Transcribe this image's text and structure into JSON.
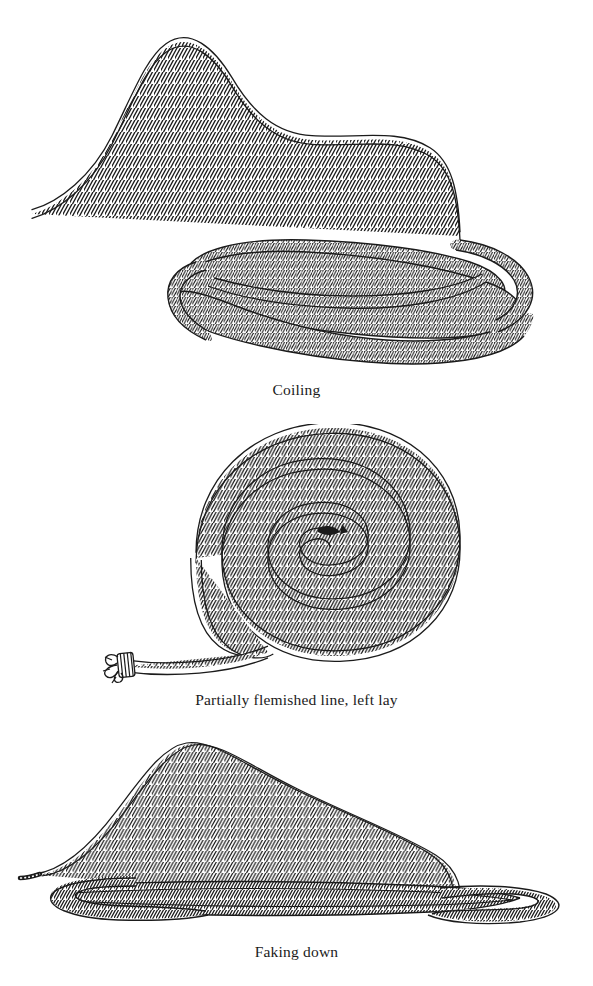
{
  "page": {
    "background_color": "#ffffff",
    "ink_color": "#1b1b1b",
    "width": 593,
    "height": 986,
    "kind": "book-illustration-plate"
  },
  "figures": [
    {
      "id": "coiling",
      "caption": "Coiling",
      "description": "A length of three-strand rope with a free running end sweeping in from the upper left, leading into a loose oval hand coil of several overlapping turns.",
      "illustration_name": "coiling-illustration",
      "caption_name": "caption-coiling"
    },
    {
      "id": "flemish",
      "caption": "Partially flemished line, left lay",
      "description": "A flat spiral Flemish coil wound in concentric turns, with the whipped rope end lying free at the lower left.",
      "illustration_name": "flemished-line-illustration",
      "caption_name": "caption-flemish"
    },
    {
      "id": "faking",
      "caption": "Faking down",
      "description": "Rope faked down in flat back-and-forth layers with elongated loops at each end and a standing part arcing overhead.",
      "illustration_name": "faking-down-illustration",
      "caption_name": "caption-faking"
    }
  ]
}
